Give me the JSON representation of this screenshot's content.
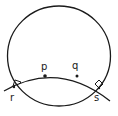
{
  "diagram": {
    "type": "geometry-sketch",
    "colors": {
      "stroke": "#1a1a1a",
      "background": "#ffffff"
    },
    "labels": {
      "p": "p",
      "q": "q",
      "r": "r",
      "s": "s"
    },
    "points": [
      {
        "name": "p",
        "x": 45,
        "y": 76,
        "marked": true
      },
      {
        "name": "q",
        "x": 77,
        "y": 76,
        "marked": true
      },
      {
        "name": "r",
        "x": 14,
        "y": 87,
        "marked": false
      },
      {
        "name": "s",
        "x": 99,
        "y": 88,
        "marked": false
      }
    ],
    "right_angle_markers": [
      "r",
      "s"
    ],
    "caption": ""
  }
}
